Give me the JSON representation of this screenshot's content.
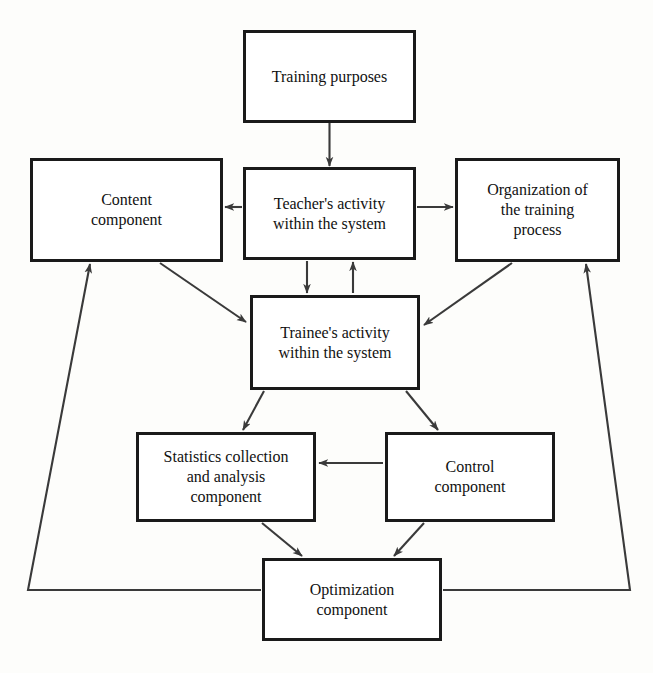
{
  "diagram": {
    "type": "flowchart",
    "canvas": {
      "width": 653,
      "height": 673
    },
    "style": {
      "box_fill": "#ffffff",
      "box_border": "#1a1a1a",
      "line_color": "#3a3a3a",
      "text_color": "#111111",
      "background": "#fdfdfb"
    },
    "nodes": [
      {
        "id": "training-purposes",
        "label": "Training purposes",
        "x": 243,
        "y": 30,
        "w": 173,
        "h": 93
      },
      {
        "id": "teachers-activity",
        "label": "Teacher's activity\nwithin the system",
        "x": 243,
        "y": 167,
        "w": 173,
        "h": 93
      },
      {
        "id": "content-component",
        "label": "Content\ncomponent",
        "x": 30,
        "y": 158,
        "w": 193,
        "h": 104
      },
      {
        "id": "organization-of-training-process",
        "label": "Organization of\nthe training\nprocess",
        "x": 455,
        "y": 158,
        "w": 165,
        "h": 104
      },
      {
        "id": "trainees-activity",
        "label": "Trainee's activity\nwithin the system",
        "x": 250,
        "y": 295,
        "w": 170,
        "h": 95
      },
      {
        "id": "statistics-component",
        "label": "Statistics collection\nand analysis\ncomponent",
        "x": 136,
        "y": 432,
        "w": 180,
        "h": 90
      },
      {
        "id": "control-component",
        "label": "Control\ncomponent",
        "x": 385,
        "y": 432,
        "w": 170,
        "h": 90
      },
      {
        "id": "optimization-component",
        "label": "Optimization\ncomponent",
        "x": 262,
        "y": 558,
        "w": 180,
        "h": 83
      }
    ],
    "edges": [
      {
        "id": "purposes-to-teacher",
        "from": "training-purposes",
        "to": "teachers-activity",
        "direction": "down",
        "arrow": "single"
      },
      {
        "id": "teacher-to-content",
        "from": "teachers-activity",
        "to": "content-component",
        "direction": "left",
        "arrow": "single"
      },
      {
        "id": "teacher-to-organization",
        "from": "teachers-activity",
        "to": "organization-of-training-process",
        "direction": "right",
        "arrow": "single"
      },
      {
        "id": "teacher-to-trainee",
        "from": "teachers-activity",
        "to": "trainees-activity",
        "direction": "down",
        "arrow": "single"
      },
      {
        "id": "trainee-to-teacher",
        "from": "trainees-activity",
        "to": "teachers-activity",
        "direction": "up",
        "arrow": "single"
      },
      {
        "id": "content-to-trainee",
        "from": "content-component",
        "to": "trainees-activity",
        "direction": "diagonal-down-right",
        "arrow": "single"
      },
      {
        "id": "organization-to-trainee",
        "from": "organization-of-training-process",
        "to": "trainees-activity",
        "direction": "diagonal-down-left",
        "arrow": "single"
      },
      {
        "id": "trainee-to-statistics",
        "from": "trainees-activity",
        "to": "statistics-component",
        "direction": "diagonal-down-left",
        "arrow": "single"
      },
      {
        "id": "trainee-to-control",
        "from": "trainees-activity",
        "to": "control-component",
        "direction": "diagonal-down-right",
        "arrow": "single"
      },
      {
        "id": "control-to-statistics",
        "from": "control-component",
        "to": "statistics-component",
        "direction": "left",
        "arrow": "single"
      },
      {
        "id": "statistics-to-optimization",
        "from": "statistics-component",
        "to": "optimization-component",
        "direction": "diagonal-down-right",
        "arrow": "single"
      },
      {
        "id": "control-to-optimization",
        "from": "control-component",
        "to": "optimization-component",
        "direction": "diagonal-down-left",
        "arrow": "single"
      },
      {
        "id": "optimization-to-content",
        "from": "optimization-component",
        "to": "content-component",
        "direction": "feedback-left-up",
        "arrow": "single"
      },
      {
        "id": "optimization-to-organization",
        "from": "optimization-component",
        "to": "organization-of-training-process",
        "direction": "feedback-right-up",
        "arrow": "single"
      }
    ]
  },
  "background_text": {
    "top_right_block": "Моделі, які заклад-\nного будови, в про-\nформат засобів з\nможливості до того",
    "middle_left_block": "має діяльність",
    "bottom_block": "для інших"
  }
}
